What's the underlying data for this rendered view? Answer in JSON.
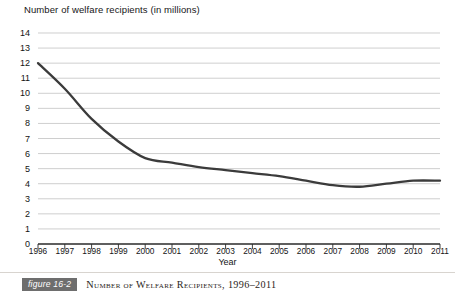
{
  "chart_data": {
    "type": "line",
    "title": "Number of welfare recipients (in millions)",
    "xlabel": "Year",
    "ylabel": "",
    "categories": [
      1996,
      1997,
      1998,
      1999,
      2000,
      2001,
      2002,
      2003,
      2004,
      2005,
      2006,
      2007,
      2008,
      2009,
      2010,
      2011
    ],
    "values": [
      12.0,
      10.3,
      8.3,
      6.8,
      5.7,
      5.4,
      5.1,
      4.9,
      4.7,
      4.5,
      4.2,
      3.9,
      3.8,
      4.0,
      4.2,
      4.2
    ],
    "x": [
      "1996",
      "1997",
      "1998",
      "1999",
      "2000",
      "2001",
      "2002",
      "2003",
      "2004",
      "2005",
      "2006",
      "2007",
      "2008",
      "2009",
      "2010",
      "2011"
    ],
    "ylim": [
      0,
      14
    ],
    "yticks": [
      0,
      1,
      2,
      3,
      4,
      5,
      6,
      7,
      8,
      9,
      10,
      11,
      12,
      13,
      14
    ],
    "ytick_labels": [
      "0",
      "1",
      "2",
      "3",
      "4",
      "5",
      "6",
      "7",
      "8",
      "9",
      "10",
      "11",
      "12",
      "13",
      "14"
    ],
    "xtick_labels": [
      "1996",
      "1997",
      "1998",
      "1999",
      "2000",
      "2001",
      "2002",
      "2003",
      "2004",
      "2005",
      "2006",
      "2007",
      "2008",
      "2009",
      "2010",
      "2011"
    ],
    "grid": "horizontal",
    "legend": "none",
    "series": [
      {
        "name": "Welfare recipients (millions)",
        "values": [
          12.0,
          10.3,
          8.3,
          6.8,
          5.7,
          5.4,
          5.1,
          4.9,
          4.7,
          4.5,
          4.2,
          3.9,
          3.8,
          4.0,
          4.2,
          4.2
        ]
      }
    ],
    "line_color": "#3b3b3b",
    "grid_color": "#b9b9b9",
    "axis_color": "#2a2a2a"
  },
  "caption": {
    "badge": "figure 16-2",
    "text": "Number of Welfare Recipients, 1996–2011"
  }
}
